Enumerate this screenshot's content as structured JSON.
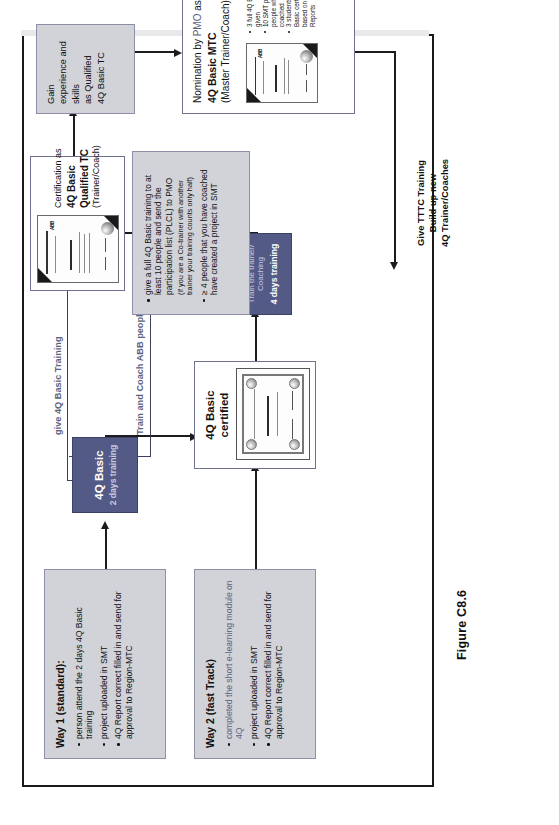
{
  "figure": {
    "caption": "Figure C8.6"
  },
  "flow_labels": {
    "give_basic": "give 4Q Basic Training",
    "train_coach": "Train and Coach ABB people in the 4Q Methodology",
    "tttc_block": [
      "Give TTTC Training",
      "Build up new",
      "4Q Trainer/Coaches"
    ]
  },
  "nodes": {
    "way1": {
      "title": "Way 1 (standard):",
      "bullets": [
        "person attend the 2 days 4Q Basic training",
        "project uploaded in SMT",
        "4Q Report correct filled in and send for approval to Region-MTC"
      ]
    },
    "way2": {
      "title": "Way 2 (fast Track)",
      "bullets": [
        "completed the short e-learning module on 4Q",
        "project uploaded in SMT",
        "4Q Report correct filled in and send for approval to Region-MTC"
      ]
    },
    "basic": {
      "title": "4Q Basic",
      "subtitle": "2 days training"
    },
    "basic_certified": {
      "title": "4Q Basic certified",
      "cert_alt": "certificate-image"
    },
    "tttc": {
      "title": "4Q TTTC",
      "sub1": "Train the trainer/",
      "sub2": "Coaching",
      "sub3": "4 days training"
    },
    "requirements": {
      "bullets": [
        "give a full 4Q Basic training to at least 10 people and send the participation list (PLCL) to PMO",
        "(if you are a Co-trainer with another trainer your training counts only half)",
        "≥ 4 people that you have coached have created a project in SMT"
      ]
    },
    "certification_tc": {
      "line1": "Certification as",
      "line2": "4Q Basic",
      "line3": "Qualified TC",
      "line4": "(Trainer/Coach)",
      "cert_alt": "certificate-image"
    },
    "gain": {
      "lines": [
        "Gain",
        "experience and",
        "skills",
        "as Qualified",
        "4Q Basic TC"
      ]
    },
    "nomination": {
      "line1_a": "Nomination by ",
      "line1_b": "PMO",
      "line1_c": " as",
      "line2": "4Q Basic MTC",
      "line3": "(Master Trainer/Coach)",
      "bullets": [
        "3 full 4Q Basic courses given",
        "10 SMT projects by people which you ave coached",
        "3 students got 4Q Basic certification based on good 4Q Reports"
      ],
      "cert_alt": "certificate-image"
    }
  },
  "colors": {
    "navy": "#535a86",
    "grey": "#d2d3d9",
    "label_blue": "#5b6280",
    "border": "#8d90a8"
  }
}
